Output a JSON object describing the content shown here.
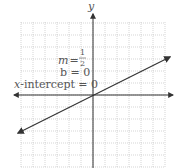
{
  "graph": {
    "axis_y_label": "y",
    "axis_x_label": "x",
    "line": {
      "slope": "1/2",
      "intercept": 0
    },
    "annotations": {
      "m_label": "m",
      "m_eq": "=",
      "m_num": "1",
      "m_den": "2",
      "b_text": "b = 0",
      "xint_var": "x",
      "xint_text": "-intercept = 0"
    },
    "colors": {
      "axis": "#333333",
      "grid": "#bbbbbb",
      "line": "#333333",
      "text": "#555555"
    }
  },
  "chart_data": {
    "type": "line",
    "title": "",
    "xlabel": "x",
    "ylabel": "y",
    "series": [
      {
        "name": "y = x/2",
        "x": [
          -6,
          6
        ],
        "y": [
          -3,
          3
        ]
      }
    ],
    "xlim": [
      -6,
      6
    ],
    "ylim": [
      -6,
      6
    ],
    "grid": true,
    "annotations": [
      "m = 1/2",
      "b = 0",
      "x-intercept = 0"
    ]
  }
}
